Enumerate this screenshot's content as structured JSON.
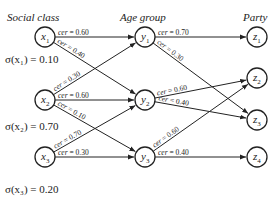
{
  "headers": {
    "social_class": "Social class",
    "age_group": "Age group",
    "party": "Party"
  },
  "nodes": {
    "x1": {
      "label": "x",
      "sub": "1",
      "cx": 45,
      "cy": 37
    },
    "x2": {
      "label": "x",
      "sub": "2",
      "cx": 45,
      "cy": 100
    },
    "x3": {
      "label": "x",
      "sub": "3",
      "cx": 45,
      "cy": 157
    },
    "y1": {
      "label": "y",
      "sub": "1",
      "cx": 145,
      "cy": 37
    },
    "y2": {
      "label": "y",
      "sub": "2",
      "cx": 145,
      "cy": 100
    },
    "y3": {
      "label": "y",
      "sub": "3",
      "cx": 145,
      "cy": 157
    },
    "z1": {
      "label": "z",
      "sub": "1",
      "cx": 257,
      "cy": 37
    },
    "z2": {
      "label": "z",
      "sub": "2",
      "cx": 257,
      "cy": 78
    },
    "z3": {
      "label": "z",
      "sub": "3",
      "cx": 257,
      "cy": 120
    },
    "z4": {
      "label": "z",
      "sub": "4",
      "cx": 257,
      "cy": 157
    }
  },
  "sigma": {
    "x1": "σ(x₁) = 0.10",
    "x2": "σ(x₂) = 0.70",
    "x3": "σ(x₃) = 0.20"
  },
  "edges": [
    {
      "from": "x1",
      "to": "y1",
      "label": "cer = 0.60"
    },
    {
      "from": "x1",
      "to": "y2",
      "label": "cer = 0.40"
    },
    {
      "from": "x2",
      "to": "y1",
      "label": "cer = 0.30"
    },
    {
      "from": "x2",
      "to": "y2",
      "label": "cer = 0.60"
    },
    {
      "from": "x2",
      "to": "y3",
      "label": "cer = 0.10"
    },
    {
      "from": "x3",
      "to": "y2",
      "label": "cer = 0.70"
    },
    {
      "from": "x3",
      "to": "y3",
      "label": "cer = 0.30"
    },
    {
      "from": "y1",
      "to": "z1",
      "label": "cer = 0.70"
    },
    {
      "from": "y1",
      "to": "z3",
      "label": "cer = 0.30"
    },
    {
      "from": "y2",
      "to": "z2",
      "label": "cer = 0.60"
    },
    {
      "from": "y2",
      "to": "z3",
      "label": "cer = 0.40"
    },
    {
      "from": "y3",
      "to": "z2",
      "label": "cer = 0.60"
    },
    {
      "from": "y3",
      "to": "z4",
      "label": "cer = 0.40"
    }
  ],
  "colors": {
    "stroke": "#222222",
    "text": "#222222",
    "background": "#ffffff"
  }
}
